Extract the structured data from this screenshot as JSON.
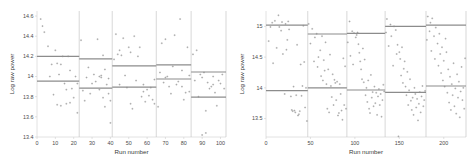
{
  "figure": {
    "background": "#ffffff",
    "point_color": "#8a8a8a",
    "level_line_color": "#8c8c8c",
    "divider_color": "#bdbdbd",
    "axis_color": "#c9c9c9"
  },
  "chart_data": [
    {
      "id": "left",
      "type": "scatter",
      "title": "",
      "xlabel": "Run number",
      "ylabel": "Log raw power",
      "xlim": [
        0,
        103
      ],
      "ylim": [
        13.4,
        14.65
      ],
      "grid": false,
      "legend": null,
      "xticks": [
        0,
        10,
        20,
        30,
        40,
        50,
        60,
        70,
        80,
        90,
        100
      ],
      "xticklabels": [
        "0",
        "10",
        "20",
        "30",
        "40",
        "50",
        "60",
        "70",
        "80",
        "90",
        "100"
      ],
      "yticks": [
        13.4,
        13.6,
        13.8,
        14,
        14.2,
        14.4,
        14.6
      ],
      "yticklabels": [
        "13.4",
        "13.6",
        "13.8",
        "14",
        "14.2",
        "14.4",
        "14.6"
      ],
      "segment_boundaries": [
        0,
        23,
        41,
        65,
        84,
        103
      ],
      "segments": [
        {
          "x_start": 0,
          "x_end": 23,
          "upper": 14.2,
          "lower": 13.955
        },
        {
          "x_start": 23,
          "x_end": 41,
          "upper": 14.175,
          "lower": 13.885
        },
        {
          "x_start": 41,
          "x_end": 65,
          "upper": 14.105,
          "lower": 13.895
        },
        {
          "x_start": 65,
          "x_end": 84,
          "upper": 14.115,
          "lower": 13.975
        },
        {
          "x_start": 84,
          "x_end": 103,
          "upper": 14.045,
          "lower": 13.795
        }
      ],
      "points": [
        [
          2,
          14.57
        ],
        [
          3,
          14.5
        ],
        [
          4,
          14.44
        ],
        [
          6,
          14.3
        ],
        [
          7,
          14.0
        ],
        [
          8,
          14.12
        ],
        [
          9,
          13.82
        ],
        [
          10,
          14.26
        ],
        [
          11,
          14.13
        ],
        [
          11,
          13.72
        ],
        [
          12,
          14.02
        ],
        [
          13,
          14.12
        ],
        [
          13,
          13.71
        ],
        [
          14,
          14.2
        ],
        [
          15,
          13.93
        ],
        [
          16,
          13.87
        ],
        [
          16,
          13.73
        ],
        [
          17,
          14.2
        ],
        [
          18,
          14.06
        ],
        [
          18,
          13.74
        ],
        [
          19,
          13.88
        ],
        [
          20,
          13.79
        ],
        [
          21,
          14.0
        ],
        [
          22,
          13.64
        ],
        [
          22,
          13.93
        ],
        [
          24,
          14.36
        ],
        [
          25,
          13.86
        ],
        [
          26,
          13.76
        ],
        [
          27,
          13.99
        ],
        [
          28,
          14.09
        ],
        [
          29,
          13.83
        ],
        [
          30,
          13.93
        ],
        [
          31,
          14.02
        ],
        [
          32,
          13.95
        ],
        [
          33,
          14.37
        ],
        [
          34,
          13.87
        ],
        [
          34,
          14.0
        ],
        [
          35,
          14.01
        ],
        [
          35,
          13.99
        ],
        [
          36,
          13.79
        ],
        [
          36,
          14.21
        ],
        [
          37,
          13.7
        ],
        [
          37,
          14.07
        ],
        [
          38,
          13.92
        ],
        [
          39,
          13.83
        ],
        [
          39,
          13.98
        ],
        [
          40,
          13.54
        ],
        [
          40,
          13.76
        ],
        [
          42,
          14.17
        ],
        [
          43,
          14.42
        ],
        [
          44,
          14.22
        ],
        [
          45,
          14.26
        ],
        [
          45,
          13.92
        ],
        [
          46,
          14.21
        ],
        [
          47,
          14.38
        ],
        [
          48,
          14.01
        ],
        [
          49,
          13.89
        ],
        [
          50,
          14.29
        ],
        [
          51,
          13.73
        ],
        [
          51,
          14.24
        ],
        [
          52,
          13.68
        ],
        [
          53,
          14.4
        ],
        [
          54,
          13.96
        ],
        [
          55,
          14.2
        ],
        [
          56,
          14.29
        ],
        [
          57,
          13.8
        ],
        [
          58,
          13.92
        ],
        [
          58,
          13.85
        ],
        [
          59,
          13.75
        ],
        [
          60,
          13.87
        ],
        [
          61,
          13.81
        ],
        [
          62,
          13.89
        ],
        [
          63,
          13.77
        ],
        [
          64,
          13.73
        ],
        [
          64,
          13.97
        ],
        [
          66,
          13.7
        ],
        [
          67,
          14.04
        ],
        [
          68,
          14.33
        ],
        [
          69,
          13.94
        ],
        [
          70,
          14.37
        ],
        [
          70,
          13.99
        ],
        [
          71,
          14.0
        ],
        [
          72,
          13.9
        ],
        [
          73,
          13.83
        ],
        [
          74,
          14.1
        ],
        [
          75,
          14.41
        ],
        [
          76,
          13.92
        ],
        [
          77,
          13.95
        ],
        [
          78,
          14.57
        ],
        [
          79,
          13.9
        ],
        [
          79,
          14.06
        ],
        [
          80,
          13.77
        ],
        [
          81,
          13.84
        ],
        [
          82,
          14.29
        ],
        [
          83,
          13.85
        ],
        [
          83,
          14.01
        ],
        [
          85,
          14.22
        ],
        [
          86,
          13.96
        ],
        [
          87,
          14.26
        ],
        [
          88,
          13.8
        ],
        [
          89,
          14.02
        ],
        [
          90,
          13.99
        ],
        [
          90,
          13.42
        ],
        [
          91,
          14.04
        ],
        [
          92,
          13.66
        ],
        [
          92,
          13.44
        ],
        [
          93,
          13.94
        ],
        [
          94,
          13.88
        ],
        [
          95,
          13.9
        ],
        [
          96,
          14.0
        ],
        [
          96,
          13.92
        ],
        [
          97,
          13.84
        ],
        [
          98,
          13.71
        ],
        [
          99,
          13.96
        ],
        [
          100,
          13.93
        ],
        [
          101,
          14.02
        ],
        [
          102,
          13.88
        ]
      ]
    },
    {
      "id": "right",
      "type": "scatter",
      "title": "",
      "xlabel": "Run number",
      "ylabel": "Log raw power",
      "xlim": [
        0,
        225
      ],
      "ylim": [
        13.2,
        15.25
      ],
      "grid": false,
      "legend": null,
      "xticks": [
        0,
        50,
        100,
        150,
        200
      ],
      "xticklabels": [
        "0",
        "50",
        "100",
        "150",
        "200"
      ],
      "yticks": [
        13.5,
        14,
        14.5,
        15
      ],
      "yticklabels": [
        "13.5",
        "14",
        "14.5",
        "15"
      ],
      "segment_boundaries": [
        0,
        47,
        91,
        134,
        180,
        225
      ],
      "segments": [
        {
          "x_start": 0,
          "x_end": 47,
          "upper": 15.02,
          "lower": 13.955
        },
        {
          "x_start": 47,
          "x_end": 91,
          "upper": 14.875,
          "lower": 14.0
        },
        {
          "x_start": 91,
          "x_end": 134,
          "upper": 14.885,
          "lower": 13.965
        },
        {
          "x_start": 134,
          "x_end": 180,
          "upper": 15.0,
          "lower": 13.925
        },
        {
          "x_start": 180,
          "x_end": 225,
          "upper": 15.02,
          "lower": 14.03
        }
      ],
      "points": [
        [
          3,
          14.76
        ],
        [
          5,
          14.99
        ],
        [
          7,
          15.06
        ],
        [
          8,
          14.4
        ],
        [
          10,
          15.09
        ],
        [
          12,
          14.65
        ],
        [
          14,
          15.18
        ],
        [
          15,
          14.99
        ],
        [
          17,
          14.93
        ],
        [
          18,
          15.07
        ],
        [
          19,
          14.55
        ],
        [
          21,
          13.9
        ],
        [
          22,
          15.04
        ],
        [
          23,
          14.62
        ],
        [
          24,
          14.78
        ],
        [
          25,
          15.08
        ],
        [
          26,
          14.95
        ],
        [
          28,
          13.86
        ],
        [
          29,
          13.64
        ],
        [
          30,
          13.62
        ],
        [
          31,
          14.02
        ],
        [
          32,
          13.63
        ],
        [
          33,
          13.6
        ],
        [
          34,
          13.88
        ],
        [
          35,
          14.7
        ],
        [
          36,
          13.55
        ],
        [
          37,
          13.57
        ],
        [
          38,
          13.62
        ],
        [
          39,
          14.38
        ],
        [
          40,
          13.87
        ],
        [
          41,
          14.03
        ],
        [
          42,
          15.01
        ],
        [
          43,
          14.42
        ],
        [
          44,
          13.68
        ],
        [
          45,
          14.0
        ],
        [
          46,
          13.46
        ],
        [
          48,
          15.04
        ],
        [
          50,
          14.72
        ],
        [
          52,
          14.96
        ],
        [
          54,
          14.43
        ],
        [
          55,
          14.82
        ],
        [
          57,
          14.88
        ],
        [
          58,
          14.34
        ],
        [
          59,
          14.5
        ],
        [
          61,
          14.61
        ],
        [
          62,
          14.19
        ],
        [
          63,
          14.84
        ],
        [
          64,
          14.12
        ],
        [
          65,
          14.45
        ],
        [
          66,
          14.28
        ],
        [
          67,
          14.74
        ],
        [
          68,
          14.06
        ],
        [
          69,
          13.66
        ],
        [
          70,
          14.3
        ],
        [
          71,
          13.6
        ],
        [
          72,
          14.54
        ],
        [
          73,
          14.03
        ],
        [
          74,
          13.85
        ],
        [
          75,
          14.22
        ],
        [
          76,
          13.72
        ],
        [
          77,
          14.13
        ],
        [
          78,
          14.08
        ],
        [
          79,
          13.8
        ],
        [
          80,
          14.1
        ],
        [
          81,
          13.55
        ],
        [
          82,
          13.59
        ],
        [
          83,
          14.06
        ],
        [
          84,
          13.9
        ],
        [
          85,
          13.63
        ],
        [
          86,
          13.48
        ],
        [
          87,
          14.48
        ],
        [
          88,
          13.72
        ],
        [
          89,
          14.35
        ],
        [
          90,
          13.66
        ],
        [
          92,
          14.74
        ],
        [
          94,
          15.08
        ],
        [
          95,
          14.52
        ],
        [
          97,
          14.92
        ],
        [
          98,
          14.38
        ],
        [
          99,
          14.89
        ],
        [
          101,
          14.82
        ],
        [
          102,
          14.86
        ],
        [
          103,
          14.9
        ],
        [
          104,
          14.71
        ],
        [
          105,
          14.57
        ],
        [
          106,
          14.43
        ],
        [
          107,
          14.3
        ],
        [
          108,
          14.14
        ],
        [
          109,
          14.64
        ],
        [
          110,
          14.09
        ],
        [
          111,
          14.46
        ],
        [
          112,
          13.88
        ],
        [
          113,
          14.0
        ],
        [
          114,
          13.77
        ],
        [
          115,
          14.12
        ],
        [
          116,
          13.66
        ],
        [
          117,
          13.59
        ],
        [
          118,
          14.21
        ],
        [
          119,
          13.84
        ],
        [
          120,
          13.93
        ],
        [
          121,
          13.7
        ],
        [
          122,
          14.02
        ],
        [
          123,
          13.75
        ],
        [
          124,
          13.92
        ],
        [
          125,
          13.56
        ],
        [
          126,
          13.86
        ],
        [
          127,
          13.98
        ],
        [
          128,
          13.72
        ],
        [
          129,
          13.9
        ],
        [
          130,
          13.53
        ],
        [
          131,
          13.8
        ],
        [
          132,
          14.05
        ],
        [
          133,
          13.94
        ],
        [
          135,
          14.9
        ],
        [
          136,
          15.12
        ],
        [
          138,
          14.68
        ],
        [
          140,
          15.03
        ],
        [
          141,
          14.84
        ],
        [
          143,
          14.36
        ],
        [
          144,
          15.0
        ],
        [
          146,
          14.94
        ],
        [
          147,
          14.55
        ],
        [
          148,
          14.7
        ],
        [
          149,
          13.21
        ],
        [
          150,
          14.58
        ],
        [
          151,
          14.47
        ],
        [
          152,
          14.2
        ],
        [
          153,
          14.66
        ],
        [
          154,
          14.08
        ],
        [
          155,
          14.31
        ],
        [
          156,
          14.43
        ],
        [
          157,
          14.02
        ],
        [
          158,
          13.88
        ],
        [
          159,
          14.26
        ],
        [
          160,
          13.72
        ],
        [
          161,
          13.96
        ],
        [
          162,
          14.14
        ],
        [
          163,
          13.79
        ],
        [
          164,
          13.64
        ],
        [
          165,
          13.84
        ],
        [
          166,
          13.56
        ],
        [
          167,
          14.0
        ],
        [
          168,
          13.9
        ],
        [
          169,
          13.68
        ],
        [
          170,
          13.82
        ],
        [
          171,
          13.47
        ],
        [
          172,
          13.74
        ],
        [
          173,
          13.93
        ],
        [
          174,
          13.6
        ],
        [
          175,
          13.86
        ],
        [
          176,
          14.03
        ],
        [
          177,
          13.7
        ],
        [
          178,
          13.8
        ],
        [
          179,
          13.95
        ],
        [
          181,
          14.78
        ],
        [
          182,
          15.16
        ],
        [
          184,
          14.92
        ],
        [
          185,
          15.06
        ],
        [
          186,
          14.6
        ],
        [
          187,
          15.13
        ],
        [
          189,
          14.84
        ],
        [
          190,
          14.47
        ],
        [
          191,
          14.98
        ],
        [
          193,
          14.72
        ],
        [
          194,
          14.36
        ],
        [
          195,
          14.88
        ],
        [
          196,
          14.55
        ],
        [
          197,
          14.24
        ],
        [
          198,
          14.66
        ],
        [
          199,
          14.12
        ],
        [
          200,
          14.44
        ],
        [
          201,
          14.02
        ],
        [
          202,
          14.8
        ],
        [
          203,
          14.58
        ],
        [
          204,
          13.92
        ],
        [
          205,
          14.3
        ],
        [
          206,
          13.76
        ],
        [
          207,
          14.18
        ],
        [
          208,
          13.64
        ],
        [
          209,
          14.06
        ],
        [
          210,
          13.88
        ],
        [
          211,
          14.4
        ],
        [
          212,
          13.7
        ],
        [
          213,
          13.99
        ],
        [
          214,
          13.58
        ],
        [
          215,
          14.22
        ],
        [
          216,
          13.84
        ],
        [
          217,
          14.1
        ],
        [
          218,
          13.52
        ],
        [
          219,
          13.94
        ],
        [
          220,
          14.34
        ],
        [
          221,
          13.8
        ],
        [
          222,
          14.0
        ],
        [
          223,
          13.66
        ],
        [
          224,
          14.48
        ]
      ]
    }
  ]
}
